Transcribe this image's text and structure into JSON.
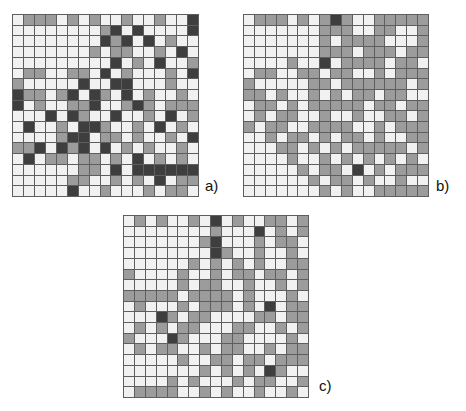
{
  "palette": {
    "cell_colors": [
      "#f1f1f1",
      "#9c9c9c",
      "#3e3e3e"
    ],
    "cell_color_names": [
      "white",
      "gray",
      "dark"
    ],
    "grid_line": "#5e5e5e",
    "background": "#ffffff",
    "label_color": "#111111"
  },
  "figure": {
    "panels": [
      {
        "id": "a",
        "label": "a)",
        "rows": 17,
        "cols": 17,
        "cells": [
          [
            0,
            1,
            1,
            1,
            0,
            1,
            0,
            1,
            0,
            0,
            1,
            0,
            0,
            1,
            0,
            0,
            2
          ],
          [
            0,
            0,
            0,
            0,
            0,
            0,
            0,
            0,
            1,
            2,
            0,
            2,
            0,
            0,
            0,
            0,
            2
          ],
          [
            0,
            0,
            0,
            0,
            0,
            0,
            0,
            0,
            2,
            1,
            2,
            0,
            2,
            0,
            1,
            0,
            0
          ],
          [
            0,
            0,
            0,
            0,
            0,
            0,
            0,
            1,
            0,
            1,
            1,
            0,
            0,
            1,
            0,
            2,
            0
          ],
          [
            0,
            0,
            0,
            0,
            0,
            0,
            0,
            0,
            0,
            2,
            0,
            1,
            0,
            2,
            0,
            0,
            1
          ],
          [
            0,
            1,
            1,
            0,
            0,
            1,
            1,
            0,
            2,
            0,
            1,
            0,
            0,
            0,
            1,
            0,
            2
          ],
          [
            1,
            0,
            0,
            0,
            0,
            0,
            2,
            0,
            0,
            2,
            2,
            0,
            0,
            0,
            1,
            0,
            0
          ],
          [
            2,
            1,
            1,
            0,
            1,
            2,
            0,
            2,
            1,
            0,
            2,
            0,
            1,
            0,
            0,
            1,
            0
          ],
          [
            2,
            0,
            1,
            0,
            0,
            1,
            1,
            2,
            0,
            0,
            1,
            2,
            1,
            0,
            1,
            1,
            1
          ],
          [
            0,
            0,
            0,
            2,
            0,
            2,
            1,
            0,
            0,
            2,
            0,
            0,
            1,
            0,
            2,
            0,
            1
          ],
          [
            0,
            2,
            0,
            0,
            1,
            0,
            2,
            2,
            1,
            0,
            0,
            1,
            0,
            2,
            0,
            1,
            0
          ],
          [
            0,
            0,
            0,
            0,
            1,
            2,
            2,
            0,
            1,
            1,
            0,
            1,
            0,
            0,
            1,
            0,
            2
          ],
          [
            1,
            1,
            2,
            0,
            2,
            1,
            2,
            0,
            2,
            0,
            1,
            0,
            1,
            0,
            0,
            1,
            0
          ],
          [
            0,
            2,
            0,
            1,
            1,
            0,
            1,
            1,
            0,
            1,
            0,
            2,
            0,
            1,
            0,
            1,
            0
          ],
          [
            0,
            0,
            0,
            0,
            0,
            0,
            1,
            1,
            0,
            2,
            0,
            2,
            2,
            2,
            2,
            2,
            2
          ],
          [
            0,
            0,
            0,
            0,
            0,
            1,
            1,
            0,
            0,
            1,
            0,
            1,
            0,
            2,
            0,
            1,
            1
          ],
          [
            0,
            0,
            0,
            0,
            0,
            2,
            0,
            0,
            1,
            0,
            0,
            0,
            1,
            0,
            1,
            1,
            0
          ]
        ]
      },
      {
        "id": "b",
        "label": "b)",
        "rows": 17,
        "cols": 17,
        "cells": [
          [
            0,
            1,
            1,
            1,
            0,
            1,
            0,
            1,
            2,
            1,
            0,
            0,
            1,
            1,
            1,
            1,
            1
          ],
          [
            0,
            0,
            0,
            0,
            0,
            0,
            0,
            1,
            1,
            1,
            0,
            0,
            1,
            1,
            0,
            0,
            1
          ],
          [
            0,
            0,
            0,
            0,
            0,
            0,
            0,
            1,
            0,
            1,
            1,
            1,
            1,
            0,
            0,
            0,
            1
          ],
          [
            0,
            0,
            0,
            0,
            0,
            0,
            0,
            1,
            1,
            1,
            0,
            1,
            1,
            1,
            0,
            1,
            1
          ],
          [
            0,
            0,
            0,
            0,
            1,
            0,
            0,
            2,
            0,
            1,
            1,
            1,
            1,
            0,
            1,
            1,
            0
          ],
          [
            0,
            1,
            1,
            0,
            0,
            1,
            1,
            0,
            1,
            1,
            0,
            0,
            1,
            0,
            1,
            1,
            1
          ],
          [
            1,
            0,
            0,
            0,
            0,
            0,
            1,
            1,
            0,
            1,
            1,
            1,
            1,
            1,
            1,
            0,
            1
          ],
          [
            1,
            1,
            0,
            1,
            0,
            0,
            1,
            0,
            1,
            0,
            1,
            1,
            0,
            1,
            1,
            0,
            0
          ],
          [
            0,
            1,
            1,
            0,
            1,
            0,
            1,
            1,
            1,
            1,
            1,
            0,
            1,
            1,
            0,
            1,
            1
          ],
          [
            0,
            1,
            0,
            1,
            1,
            0,
            0,
            1,
            0,
            0,
            1,
            0,
            0,
            1,
            1,
            0,
            1
          ],
          [
            1,
            0,
            1,
            1,
            0,
            0,
            1,
            1,
            1,
            1,
            0,
            0,
            1,
            0,
            1,
            1,
            1
          ],
          [
            0,
            0,
            1,
            0,
            1,
            1,
            0,
            1,
            0,
            1,
            1,
            0,
            1,
            0,
            0,
            1,
            1
          ],
          [
            0,
            0,
            0,
            1,
            1,
            0,
            1,
            0,
            1,
            0,
            1,
            1,
            1,
            1,
            1,
            0,
            1
          ],
          [
            0,
            0,
            0,
            0,
            1,
            0,
            0,
            1,
            0,
            1,
            0,
            1,
            0,
            1,
            0,
            1,
            0
          ],
          [
            0,
            0,
            0,
            0,
            0,
            1,
            0,
            1,
            1,
            0,
            2,
            0,
            1,
            0,
            1,
            1,
            1
          ],
          [
            0,
            0,
            0,
            0,
            0,
            0,
            1,
            0,
            1,
            1,
            0,
            1,
            0,
            0,
            1,
            0,
            0
          ],
          [
            0,
            0,
            0,
            0,
            0,
            0,
            0,
            1,
            0,
            1,
            0,
            0,
            1,
            1,
            1,
            1,
            1
          ]
        ]
      },
      {
        "id": "c",
        "label": "c)",
        "rows": 17,
        "cols": 17,
        "cells": [
          [
            0,
            1,
            0,
            1,
            0,
            0,
            1,
            0,
            2,
            0,
            1,
            0,
            0,
            1,
            1,
            0,
            1
          ],
          [
            0,
            0,
            0,
            0,
            0,
            0,
            0,
            0,
            1,
            0,
            0,
            0,
            2,
            0,
            1,
            0,
            1
          ],
          [
            0,
            0,
            0,
            0,
            0,
            0,
            0,
            1,
            2,
            0,
            0,
            0,
            1,
            0,
            1,
            1,
            0
          ],
          [
            0,
            0,
            0,
            0,
            0,
            0,
            0,
            0,
            2,
            1,
            0,
            0,
            1,
            0,
            0,
            1,
            0
          ],
          [
            0,
            0,
            0,
            0,
            0,
            0,
            1,
            0,
            1,
            0,
            1,
            0,
            1,
            0,
            0,
            1,
            1
          ],
          [
            1,
            0,
            0,
            0,
            0,
            1,
            0,
            0,
            1,
            0,
            1,
            1,
            0,
            1,
            1,
            0,
            1
          ],
          [
            0,
            0,
            0,
            0,
            0,
            1,
            0,
            1,
            1,
            0,
            0,
            1,
            0,
            0,
            1,
            0,
            1
          ],
          [
            1,
            1,
            1,
            1,
            1,
            0,
            1,
            1,
            1,
            1,
            0,
            1,
            0,
            0,
            0,
            1,
            0
          ],
          [
            0,
            1,
            0,
            0,
            0,
            1,
            0,
            1,
            1,
            1,
            0,
            1,
            0,
            2,
            0,
            1,
            1
          ],
          [
            0,
            0,
            0,
            2,
            1,
            0,
            1,
            1,
            0,
            0,
            0,
            0,
            1,
            1,
            0,
            1,
            1
          ],
          [
            0,
            1,
            0,
            1,
            0,
            1,
            1,
            0,
            0,
            0,
            1,
            1,
            0,
            0,
            1,
            0,
            1
          ],
          [
            1,
            0,
            0,
            0,
            2,
            1,
            0,
            0,
            0,
            1,
            1,
            0,
            0,
            0,
            0,
            1,
            0
          ],
          [
            0,
            1,
            0,
            1,
            1,
            0,
            0,
            1,
            0,
            1,
            1,
            0,
            0,
            1,
            0,
            1,
            1
          ],
          [
            0,
            0,
            0,
            0,
            0,
            1,
            0,
            0,
            1,
            1,
            0,
            1,
            1,
            0,
            1,
            1,
            1
          ],
          [
            0,
            0,
            0,
            0,
            0,
            0,
            0,
            1,
            0,
            1,
            0,
            1,
            0,
            2,
            1,
            0,
            0
          ],
          [
            0,
            0,
            0,
            0,
            1,
            0,
            1,
            0,
            0,
            0,
            1,
            0,
            1,
            1,
            0,
            0,
            1
          ],
          [
            0,
            1,
            1,
            1,
            1,
            0,
            0,
            1,
            0,
            1,
            0,
            0,
            1,
            0,
            0,
            1,
            0
          ]
        ]
      }
    ]
  }
}
